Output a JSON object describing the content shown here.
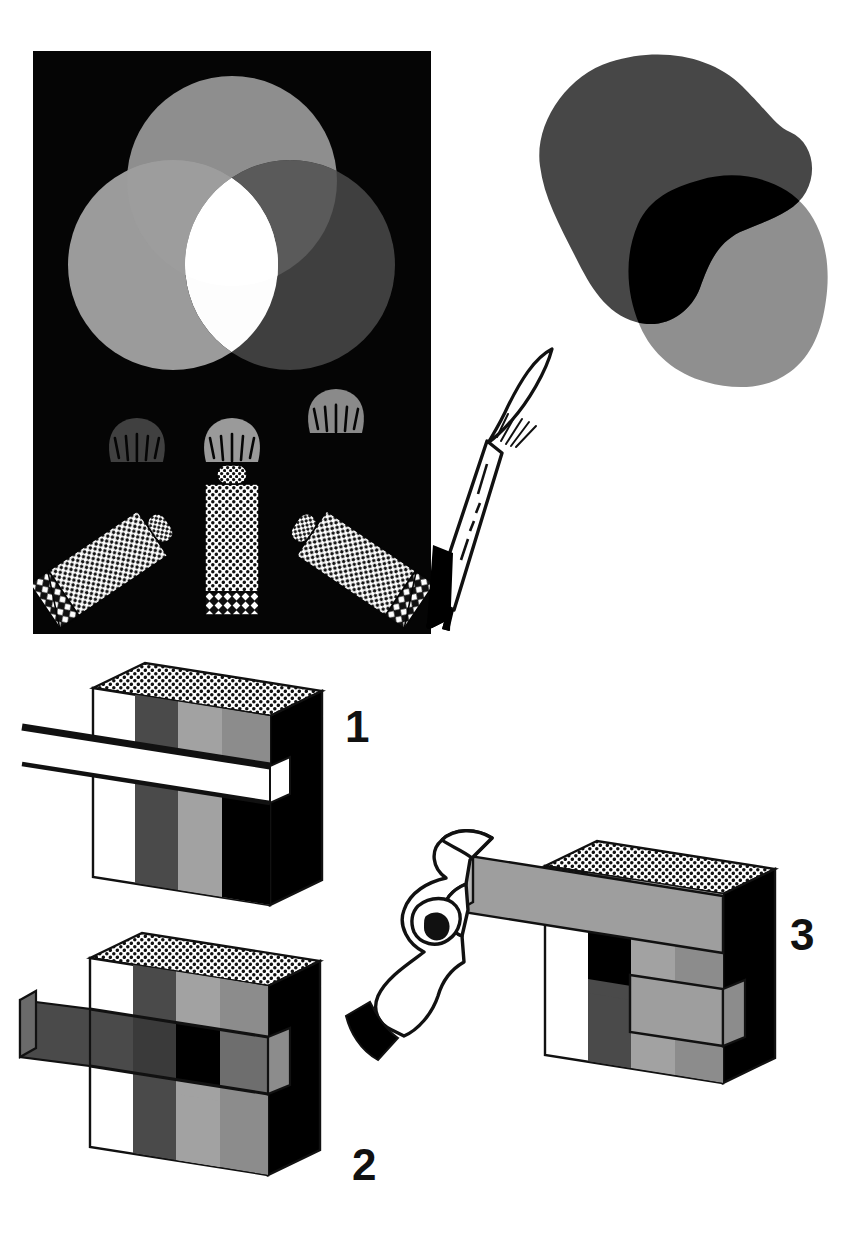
{
  "figure": {
    "background_color": "#ffffff",
    "ink_color": "#111111",
    "style": "grayscale line-and-halftone technical illustration"
  },
  "panels": [
    {
      "id": "additive-light-panel",
      "name": "Additive colour mixing with three coloured lights",
      "background_color": "#050505",
      "frame": {
        "x": 33,
        "y": 51,
        "width": 398,
        "height": 583
      },
      "circles": [
        {
          "name": "top-light-circle",
          "label": "green light",
          "cx": 232,
          "cy": 181,
          "r": 105,
          "fill": "#8e8e8e",
          "opacity": 1
        },
        {
          "name": "left-light-circle",
          "label": "blue light",
          "cx": 173,
          "cy": 265,
          "r": 105,
          "fill": "#9b9b9b",
          "opacity": 1
        },
        {
          "name": "right-light-circle",
          "label": "red light",
          "cx": 290,
          "cy": 265,
          "r": 105,
          "fill": "#3f3f3f",
          "opacity": 1
        }
      ],
      "overlap_center": {
        "name": "white-light-overlap",
        "fill": "#fdfdfd",
        "note": "all three lights overlap to make white"
      },
      "tubes": [
        {
          "name": "paint-tube-left",
          "body_fill": "#ffffff",
          "pattern": "halftone-dots",
          "cap_pattern": "halftone-diamond",
          "splat_fill": "#404040",
          "rotation": -34
        },
        {
          "name": "paint-tube-middle",
          "body_fill": "#ffffff",
          "pattern": "halftone-dots",
          "cap_pattern": "halftone-diamond",
          "splat_fill": "#9a9a9a",
          "rotation": 0
        },
        {
          "name": "paint-tube-right",
          "body_fill": "#ffffff",
          "pattern": "halftone-dots",
          "cap_pattern": "halftone-diamond",
          "splat_fill": "#8a8a8a",
          "rotation": 34
        }
      ]
    },
    {
      "id": "subtractive-paint-panel",
      "name": "Subtractive colour mixing with two paint blobs and a brush",
      "background_color": "#ffffff",
      "blobs": [
        {
          "name": "dark-paint-blob",
          "fill": "#474747",
          "note": "upper-left blob"
        },
        {
          "name": "light-paint-blob",
          "fill": "#8f8f8f",
          "note": "lower-right blob"
        },
        {
          "name": "blob-overlap",
          "fill": "#000000",
          "note": "overlap of the two paints is black"
        }
      ],
      "brush": {
        "name": "paintbrush",
        "handle_fill": "#ffffff",
        "handle_stroke": "#111111",
        "tip_fill": "#000000",
        "bristles_fill": "#ffffff",
        "ferrule_marks": 4
      }
    }
  ],
  "blocks": [
    {
      "id": "block-1",
      "label": "1",
      "name": "striped-block-filter-entering",
      "caption_position": {
        "x": 345,
        "y": 742
      },
      "top_face_pattern": "halftone-dots",
      "side_face_fill": "#000000",
      "stripes": [
        {
          "name": "stripe-white",
          "fill": "#ffffff"
        },
        {
          "name": "stripe-dark-gray",
          "fill": "#4a4a4a"
        },
        {
          "name": "stripe-light-gray",
          "fill": "#a2a2a2"
        },
        {
          "name": "stripe-mid-gray",
          "fill": "#8c8c8c"
        }
      ],
      "filter_strip": {
        "name": "clear-filter-strip",
        "fill": "#ffffff",
        "state": "mostly outside the block"
      },
      "band_colors_behind_filter": [
        "#ffffff",
        "#4a4a4a",
        "#a2a2a2",
        "#000000"
      ]
    },
    {
      "id": "block-2",
      "label": "2",
      "name": "striped-block-filter-inserted",
      "caption_position": {
        "x": 352,
        "y": 1180
      },
      "top_face_pattern": "halftone-dots",
      "side_face_fill": "#000000",
      "stripes": [
        {
          "name": "stripe-white",
          "fill": "#ffffff"
        },
        {
          "name": "stripe-dark-gray",
          "fill": "#4a4a4a"
        },
        {
          "name": "stripe-light-gray",
          "fill": "#a2a2a2"
        },
        {
          "name": "stripe-mid-gray",
          "fill": "#8c8c8c"
        }
      ],
      "filter_strip": {
        "name": "dark-filter-strip",
        "fill": "#4a4a4a",
        "state": "inserted across the block"
      },
      "band_colors_behind_filter": [
        "#4a4a4a",
        "#3a3a3a",
        "#000000",
        "#6e6e6e"
      ]
    },
    {
      "id": "block-3",
      "label": "3",
      "name": "striped-block-filter-withdrawn-by-hand",
      "caption_position": {
        "x": 790,
        "y": 950
      },
      "top_face_pattern": "halftone-dots",
      "side_face_fill": "#000000",
      "stripes": [
        {
          "name": "stripe-white",
          "fill": "#ffffff"
        },
        {
          "name": "stripe-dark-gray",
          "fill": "#4a4a4a"
        },
        {
          "name": "stripe-light-gray",
          "fill": "#a2a2a2"
        },
        {
          "name": "stripe-mid-gray",
          "fill": "#8c8c8c"
        }
      ],
      "filter_strip": {
        "name": "light-filter-strip",
        "fill": "#9e9e9e",
        "state": "being pulled out by hand"
      },
      "hand": {
        "name": "hand-pulling-filter",
        "skin_fill": "#ffffff",
        "outline": "#111111",
        "cuff_fill": "#000000"
      }
    }
  ],
  "captions": {
    "one": "1",
    "two": "2",
    "three": "3"
  },
  "colors": {
    "black": "#000000",
    "panel_black": "#050505",
    "white": "#ffffff",
    "ink": "#111111",
    "dark_gray": "#4a4a4a",
    "mid_gray": "#8c8c8c",
    "light_gray": "#a2a2a2",
    "blob_dark": "#474747",
    "blob_light": "#8f8f8f"
  }
}
